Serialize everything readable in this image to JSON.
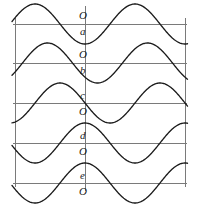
{
  "figure": {
    "axis_color": "#7a7a7a",
    "curve_color": "#1b1b1b",
    "background_color": "#ffffff"
  },
  "geometry": {
    "width": 201,
    "height": 217,
    "left_x": 15,
    "center_x": 85,
    "right_x": 185,
    "axis_y": [
      24,
      63,
      103,
      143,
      183
    ],
    "row_spacing": 40,
    "amplitude": 20,
    "wavelength": 100
  },
  "labels": [
    {
      "id": "origin-a",
      "text": "O",
      "x": 79,
      "y": 10
    },
    {
      "id": "wave-a",
      "text": "a",
      "x": 80,
      "y": 26
    },
    {
      "id": "origin-b",
      "text": "O",
      "x": 79,
      "y": 49
    },
    {
      "id": "wave-b",
      "text": "b",
      "x": 80,
      "y": 65
    },
    {
      "id": "wave-c",
      "text": "c",
      "x": 80,
      "y": 90
    },
    {
      "id": "origin-c",
      "text": "O",
      "x": 79,
      "y": 106
    },
    {
      "id": "wave-d",
      "text": "d",
      "x": 80,
      "y": 130
    },
    {
      "id": "origin-d",
      "text": "O",
      "x": 79,
      "y": 146
    },
    {
      "id": "wave-e",
      "text": "e",
      "x": 80,
      "y": 170
    },
    {
      "id": "origin-e",
      "text": "O",
      "x": 79,
      "y": 186
    }
  ],
  "chart_data": {
    "type": "line",
    "xlabel": "",
    "ylabel": "",
    "grid": true,
    "legend": "none",
    "x": [
      -70,
      -60,
      -50,
      -40,
      -30,
      -20,
      -10,
      0,
      10,
      20,
      30,
      40,
      50,
      60,
      70,
      80,
      90,
      100
    ],
    "xlim": [
      -70,
      100
    ],
    "ylim": [
      -20,
      20
    ],
    "axis_lines_y": [
      24,
      63,
      103,
      143,
      183
    ],
    "shared": {
      "amplitude": 20,
      "wavelength": 100,
      "form": "y = A*cos(2*pi*x/wavelength + phase)"
    },
    "series": [
      {
        "name": "a",
        "label": "a",
        "phase_degrees": 180,
        "value_at_origin": -20,
        "slope_at_origin": 0,
        "description": "minimum (trough) at the origin",
        "baseline_y": 24
      },
      {
        "name": "b",
        "label": "b",
        "phase_degrees": 135,
        "value_at_origin": -14,
        "slope_at_origin": -1,
        "description": "descending past the axis, trough just right of the origin",
        "baseline_y": 63
      },
      {
        "name": "c",
        "label": "c",
        "phase_degrees": 90,
        "value_at_origin": 0,
        "slope_at_origin": -1,
        "description": "descending zero-crossing exactly at the origin",
        "baseline_y": 103
      },
      {
        "name": "d",
        "label": "d",
        "phase_degrees": 0,
        "value_at_origin": 20,
        "slope_at_origin": 0,
        "description": "maximum (crest) at the origin",
        "baseline_y": 143
      },
      {
        "name": "e",
        "label": "e",
        "phase_degrees": 0,
        "value_at_origin": 20,
        "slope_at_origin": 0,
        "description": "maximum (crest) at the origin, lowest row",
        "baseline_y": 183
      }
    ]
  }
}
